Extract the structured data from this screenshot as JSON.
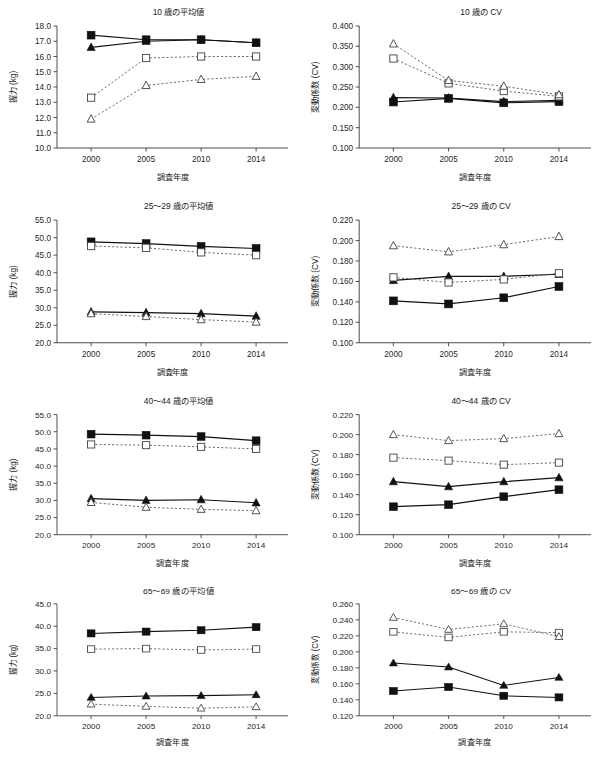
{
  "figure": {
    "caption": "",
    "years": [
      2000,
      2005,
      2010,
      2014
    ],
    "xlabel": "調査年度",
    "ylabel_mean": "握力 (kg)",
    "ylabel_cv": "変動係数 (CV)"
  },
  "series_names": {
    "male_measured": "男子・実測 (■ 実線)",
    "male_ref": "男子・参照 (□ 点線)",
    "female_measured": "女子・実測 (▲ 実線)",
    "female_ref": "女子・参照 (△ 点線)"
  },
  "chart_data": [
    {
      "id": "mean-10",
      "type": "line",
      "title": "10 歳の平均値",
      "xlabel": "調査年度",
      "ylabel": "握力 (kg)",
      "x": [
        2000,
        2005,
        2010,
        2014
      ],
      "xticklabels": [
        "2000",
        "2005",
        "2010",
        "2014"
      ],
      "ylim": [
        10.0,
        18.0
      ],
      "yticks": [
        10.0,
        11.0,
        12.0,
        13.0,
        14.0,
        15.0,
        16.0,
        17.0,
        18.0
      ],
      "yticklabels": [
        "10.0",
        "11.0",
        "12.0",
        "13.0",
        "14.0",
        "15.0",
        "16.0",
        "17.0",
        "18.0"
      ],
      "grid": false,
      "legend": "none",
      "series": [
        {
          "name": "male_measured",
          "marker": "filled-square",
          "line": "solid",
          "values": [
            17.4,
            17.1,
            17.1,
            16.9
          ]
        },
        {
          "name": "female_measured",
          "marker": "filled-triangle",
          "line": "solid",
          "values": [
            16.6,
            17.0,
            17.1,
            16.9
          ]
        },
        {
          "name": "male_ref",
          "marker": "open-square",
          "line": "dotted",
          "values": [
            13.3,
            15.9,
            16.0,
            16.0
          ]
        },
        {
          "name": "female_ref",
          "marker": "open-triangle",
          "line": "dotted",
          "values": [
            11.9,
            14.1,
            14.5,
            14.7
          ]
        }
      ]
    },
    {
      "id": "cv-10",
      "type": "line",
      "title": "10 歳の CV",
      "xlabel": "調査年度",
      "ylabel": "変動係数 (CV)",
      "x": [
        2000,
        2005,
        2010,
        2014
      ],
      "xticklabels": [
        "2000",
        "2005",
        "2010",
        "2014"
      ],
      "ylim": [
        0.1,
        0.4
      ],
      "yticks": [
        0.1,
        0.15,
        0.2,
        0.25,
        0.3,
        0.35,
        0.4
      ],
      "yticklabels": [
        "0.100",
        "0.150",
        "0.200",
        "0.250",
        "0.300",
        "0.350",
        "0.400"
      ],
      "grid": false,
      "legend": "none",
      "series": [
        {
          "name": "male_measured",
          "marker": "filled-square",
          "line": "solid",
          "values": [
            0.213,
            0.222,
            0.211,
            0.214
          ]
        },
        {
          "name": "female_measured",
          "marker": "filled-triangle",
          "line": "solid",
          "values": [
            0.224,
            0.223,
            0.214,
            0.217
          ]
        },
        {
          "name": "male_ref",
          "marker": "open-square",
          "line": "dotted",
          "values": [
            0.32,
            0.259,
            0.24,
            0.227
          ]
        },
        {
          "name": "female_ref",
          "marker": "open-triangle",
          "line": "dotted",
          "values": [
            0.356,
            0.266,
            0.252,
            0.231
          ]
        }
      ]
    },
    {
      "id": "mean-25-29",
      "type": "line",
      "title": "25～29 歳の平均値",
      "xlabel": "調査年度",
      "ylabel": "握力 (kg)",
      "x": [
        2000,
        2005,
        2010,
        2014
      ],
      "xticklabels": [
        "2000",
        "2005",
        "2010",
        "2014"
      ],
      "ylim": [
        20.0,
        55.0
      ],
      "yticks": [
        20.0,
        25.0,
        30.0,
        35.0,
        40.0,
        45.0,
        50.0,
        55.0
      ],
      "yticklabels": [
        "20.0",
        "25.0",
        "30.0",
        "35.0",
        "40.0",
        "45.0",
        "50.0",
        "55.0"
      ],
      "grid": false,
      "legend": "none",
      "series": [
        {
          "name": "male_measured",
          "marker": "filled-square",
          "line": "solid",
          "values": [
            48.8,
            48.3,
            47.5,
            46.9
          ]
        },
        {
          "name": "male_ref",
          "marker": "open-square",
          "line": "dotted",
          "values": [
            47.6,
            47.1,
            45.8,
            45.0
          ]
        },
        {
          "name": "female_measured",
          "marker": "filled-triangle",
          "line": "solid",
          "values": [
            28.8,
            28.6,
            28.3,
            27.6
          ]
        },
        {
          "name": "female_ref",
          "marker": "open-triangle",
          "line": "dotted",
          "values": [
            28.3,
            27.5,
            26.6,
            25.9
          ]
        }
      ]
    },
    {
      "id": "cv-25-29",
      "type": "line",
      "title": "25～29 歳の CV",
      "xlabel": "調査年度",
      "ylabel": "変動係数 (CV)",
      "x": [
        2000,
        2005,
        2010,
        2014
      ],
      "xticklabels": [
        "2000",
        "2005",
        "2010",
        "2014"
      ],
      "ylim": [
        0.1,
        0.22
      ],
      "yticks": [
        0.1,
        0.12,
        0.14,
        0.16,
        0.18,
        0.2,
        0.22
      ],
      "yticklabels": [
        "0.100",
        "0.120",
        "0.140",
        "0.160",
        "0.180",
        "0.200",
        "0.220"
      ],
      "grid": false,
      "legend": "none",
      "series": [
        {
          "name": "male_measured",
          "marker": "filled-square",
          "line": "solid",
          "values": [
            0.141,
            0.138,
            0.144,
            0.155
          ]
        },
        {
          "name": "female_measured",
          "marker": "filled-triangle",
          "line": "solid",
          "values": [
            0.161,
            0.165,
            0.165,
            0.167
          ]
        },
        {
          "name": "male_ref",
          "marker": "open-square",
          "line": "dotted",
          "values": [
            0.164,
            0.159,
            0.162,
            0.168
          ]
        },
        {
          "name": "female_ref",
          "marker": "open-triangle",
          "line": "dotted",
          "values": [
            0.195,
            0.189,
            0.196,
            0.204
          ]
        }
      ]
    },
    {
      "id": "mean-40-44",
      "type": "line",
      "title": "40～44 歳の平均値",
      "xlabel": "調査年度",
      "ylabel": "握力 (kg)",
      "x": [
        2000,
        2005,
        2010,
        2014
      ],
      "xticklabels": [
        "2000",
        "2005",
        "2010",
        "2014"
      ],
      "ylim": [
        20.0,
        55.0
      ],
      "yticks": [
        20.0,
        25.0,
        30.0,
        35.0,
        40.0,
        45.0,
        50.0,
        55.0
      ],
      "yticklabels": [
        "20.0",
        "25.0",
        "30.0",
        "35.0",
        "40.0",
        "45.0",
        "50.0",
        "55.0"
      ],
      "grid": false,
      "legend": "none",
      "series": [
        {
          "name": "male_measured",
          "marker": "filled-square",
          "line": "solid",
          "values": [
            49.3,
            49.0,
            48.6,
            47.4
          ]
        },
        {
          "name": "male_ref",
          "marker": "open-square",
          "line": "dotted",
          "values": [
            46.3,
            46.1,
            45.6,
            45.0
          ]
        },
        {
          "name": "female_measured",
          "marker": "filled-triangle",
          "line": "solid",
          "values": [
            30.5,
            30.0,
            30.2,
            29.3
          ]
        },
        {
          "name": "female_ref",
          "marker": "open-triangle",
          "line": "dotted",
          "values": [
            29.4,
            28.0,
            27.4,
            27.0
          ]
        }
      ]
    },
    {
      "id": "cv-40-44",
      "type": "line",
      "title": "40～44 歳の CV",
      "xlabel": "調査年度",
      "ylabel": "変動係数 (CV)",
      "x": [
        2000,
        2005,
        2010,
        2014
      ],
      "xticklabels": [
        "2000",
        "2005",
        "2010",
        "2014"
      ],
      "ylim": [
        0.1,
        0.22
      ],
      "yticks": [
        0.1,
        0.12,
        0.14,
        0.16,
        0.18,
        0.2,
        0.22
      ],
      "yticklabels": [
        "0.100",
        "0.120",
        "0.140",
        "0.160",
        "0.180",
        "0.200",
        "0.220"
      ],
      "grid": false,
      "legend": "none",
      "series": [
        {
          "name": "male_measured",
          "marker": "filled-square",
          "line": "solid",
          "values": [
            0.128,
            0.13,
            0.138,
            0.145
          ]
        },
        {
          "name": "female_measured",
          "marker": "filled-triangle",
          "line": "solid",
          "values": [
            0.153,
            0.148,
            0.153,
            0.157
          ]
        },
        {
          "name": "male_ref",
          "marker": "open-square",
          "line": "dotted",
          "values": [
            0.177,
            0.174,
            0.17,
            0.172
          ]
        },
        {
          "name": "female_ref",
          "marker": "open-triangle",
          "line": "dotted",
          "values": [
            0.2,
            0.194,
            0.196,
            0.201
          ]
        }
      ]
    },
    {
      "id": "mean-65-69",
      "type": "line",
      "title": "65～69 歳の平均値",
      "xlabel": "調査年度",
      "ylabel": "握力 (kg)",
      "x": [
        2000,
        2005,
        2010,
        2014
      ],
      "xticklabels": [
        "2000",
        "2005",
        "2010",
        "2014"
      ],
      "ylim": [
        20.0,
        45.0
      ],
      "yticks": [
        20.0,
        25.0,
        30.0,
        35.0,
        40.0,
        45.0
      ],
      "yticklabels": [
        "20.0",
        "25.0",
        "30.0",
        "35.0",
        "40.0",
        "45.0"
      ],
      "grid": false,
      "legend": "none",
      "series": [
        {
          "name": "male_measured",
          "marker": "filled-square",
          "line": "solid",
          "values": [
            38.4,
            38.8,
            39.1,
            39.8
          ]
        },
        {
          "name": "male_ref",
          "marker": "open-square",
          "line": "dotted",
          "values": [
            34.9,
            35.0,
            34.7,
            34.9
          ]
        },
        {
          "name": "female_measured",
          "marker": "filled-triangle",
          "line": "solid",
          "values": [
            24.1,
            24.4,
            24.5,
            24.7
          ]
        },
        {
          "name": "female_ref",
          "marker": "open-triangle",
          "line": "dotted",
          "values": [
            22.6,
            22.1,
            21.7,
            22.0
          ]
        }
      ]
    },
    {
      "id": "cv-65-69",
      "type": "line",
      "title": "65～69 歳の CV",
      "xlabel": "調査年度",
      "ylabel": "変動係数 (CV)",
      "x": [
        2000,
        2005,
        2010,
        2014
      ],
      "xticklabels": [
        "2000",
        "2005",
        "2010",
        "2014"
      ],
      "ylim": [
        0.12,
        0.26
      ],
      "yticks": [
        0.12,
        0.14,
        0.16,
        0.18,
        0.2,
        0.22,
        0.24,
        0.26
      ],
      "yticklabels": [
        "0.120",
        "0.140",
        "0.160",
        "0.180",
        "0.200",
        "0.220",
        "0.240",
        "0.260"
      ],
      "grid": false,
      "legend": "none",
      "series": [
        {
          "name": "male_measured",
          "marker": "filled-square",
          "line": "solid",
          "values": [
            0.151,
            0.156,
            0.145,
            0.143
          ]
        },
        {
          "name": "female_measured",
          "marker": "filled-triangle",
          "line": "solid",
          "values": [
            0.186,
            0.181,
            0.158,
            0.168
          ]
        },
        {
          "name": "male_ref",
          "marker": "open-square",
          "line": "dotted",
          "values": [
            0.225,
            0.218,
            0.225,
            0.224
          ]
        },
        {
          "name": "female_ref",
          "marker": "open-triangle",
          "line": "dotted",
          "values": [
            0.243,
            0.228,
            0.235,
            0.219
          ]
        }
      ]
    }
  ]
}
